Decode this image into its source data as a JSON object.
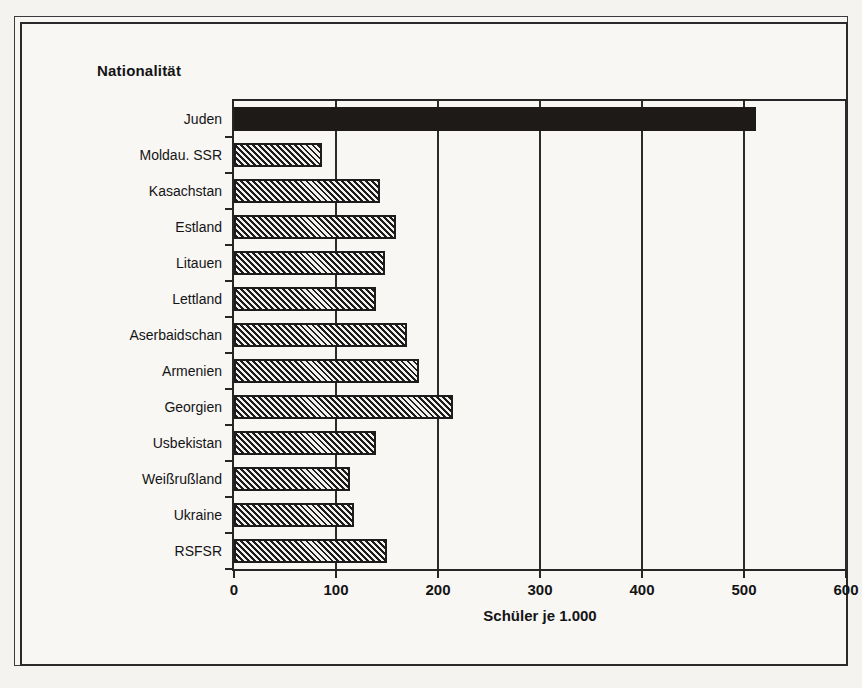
{
  "figure": {
    "category_axis_title": "Nationalität",
    "value_axis_title": "Schüler je 1.000"
  },
  "chart_data": {
    "type": "bar",
    "orientation": "horizontal",
    "title": "",
    "xlabel": "Schüler je 1.000",
    "ylabel": "Nationalität",
    "xlim": [
      0,
      600
    ],
    "xticks": [
      0,
      100,
      200,
      300,
      400,
      500,
      600
    ],
    "xtick_labels": [
      "0",
      "100",
      "200",
      "300",
      "400",
      "500",
      "600"
    ],
    "grid": "vertical",
    "legend": "none",
    "categories": [
      "Juden",
      "Moldau. SSR",
      "Kasachstan",
      "Estland",
      "Litauen",
      "Lettland",
      "Aserbaidschan",
      "Armenien",
      "Georgien",
      "Usbekistan",
      "Weißrußland",
      "Ukraine",
      "RSFSR"
    ],
    "values": [
      512,
      86,
      143,
      159,
      148,
      139,
      170,
      181,
      215,
      139,
      114,
      118,
      150
    ],
    "bar_styles": [
      "solid-black",
      "hatched",
      "hatched",
      "hatched",
      "hatched",
      "hatched",
      "hatched",
      "hatched",
      "hatched",
      "hatched",
      "hatched",
      "hatched",
      "hatched"
    ]
  },
  "colors": {
    "ink": "#1c1c1c",
    "paper": "#f7f6f3",
    "highlight_bar": "#1d1a17"
  }
}
